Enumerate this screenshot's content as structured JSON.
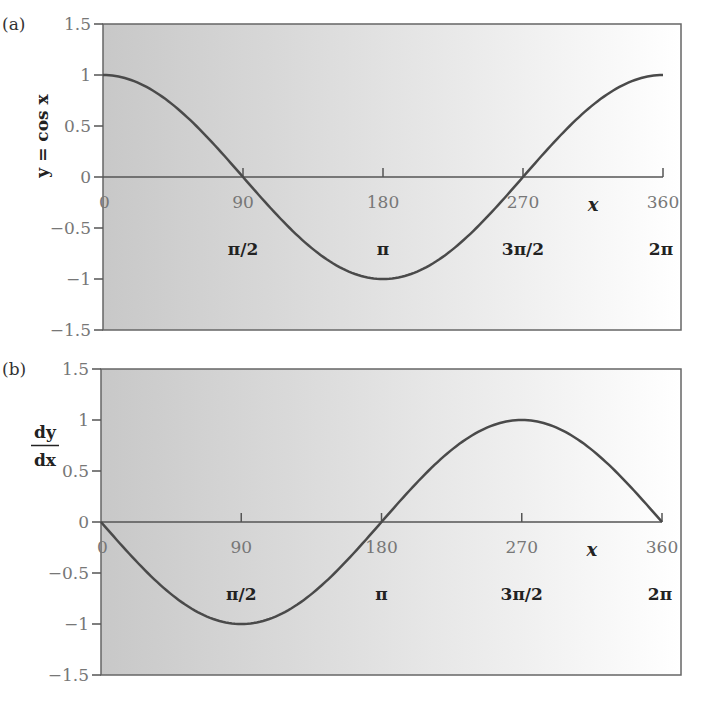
{
  "chart_data": [
    {
      "type": "line",
      "panel_label": "(a)",
      "title": "",
      "ylabel": "y = cos x",
      "xlabel": "x",
      "xlim": [
        0,
        360
      ],
      "ylim": [
        -1.5,
        1.5
      ],
      "yticks": [
        "1.5",
        "1",
        "0.5",
        "0",
        "-0.5",
        "-1",
        "-1.5"
      ],
      "xticks": [
        "0",
        "90",
        "180",
        "270",
        "360"
      ],
      "radian_labels": [
        "π/2",
        "π",
        "3π/2",
        "2π"
      ],
      "grid": false,
      "series": [
        {
          "name": "cos x",
          "x": [
            0,
            30,
            60,
            90,
            120,
            150,
            180,
            210,
            240,
            270,
            300,
            330,
            360
          ],
          "values": [
            1,
            0.87,
            0.5,
            0,
            -0.5,
            -0.87,
            -1,
            -0.87,
            -0.5,
            0,
            0.5,
            0.87,
            1
          ]
        }
      ]
    },
    {
      "type": "line",
      "panel_label": "(b)",
      "title": "",
      "ylabel": "dy/dx",
      "ylabel_numerator": "dy",
      "ylabel_denominator": "dx",
      "xlabel": "x",
      "xlim": [
        0,
        360
      ],
      "ylim": [
        -1.5,
        1.5
      ],
      "yticks": [
        "1.5",
        "1",
        "0.5",
        "0",
        "-0.5",
        "-1",
        "-1.5"
      ],
      "xticks": [
        "0",
        "90",
        "180",
        "270",
        "360"
      ],
      "radian_labels": [
        "π/2",
        "π",
        "3π/2",
        "2π"
      ],
      "grid": false,
      "series": [
        {
          "name": "-sin x",
          "x": [
            0,
            30,
            60,
            90,
            120,
            150,
            180,
            210,
            240,
            270,
            300,
            330,
            360
          ],
          "values": [
            0,
            -0.5,
            -0.87,
            -1,
            -0.87,
            -0.5,
            0,
            0.5,
            0.87,
            1,
            0.87,
            0.5,
            0
          ]
        }
      ]
    }
  ],
  "colors": {
    "curve": "#4a4a4a",
    "axis": "#555555",
    "bg_left": "#c9c9c9",
    "bg_right": "#ffffff"
  }
}
